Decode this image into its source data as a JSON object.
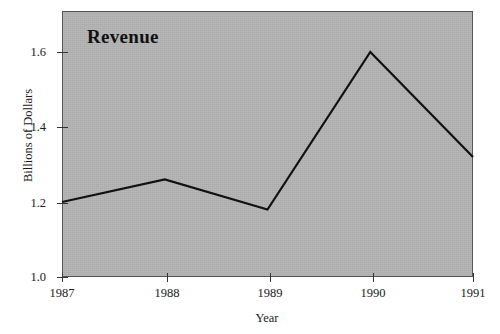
{
  "chart_data": {
    "type": "line",
    "title": "Revenue",
    "xlabel": "Year",
    "ylabel": "Billions of Dollars",
    "categories": [
      "1987",
      "1988",
      "1989",
      "1990",
      "1991"
    ],
    "x": [
      1987,
      1988,
      1989,
      1990,
      1991
    ],
    "values": [
      1.2,
      1.26,
      1.18,
      1.6,
      1.32
    ],
    "series": [
      {
        "name": "Revenue",
        "values": [
          1.2,
          1.26,
          1.18,
          1.6,
          1.32
        ]
      }
    ],
    "xlim": [
      1987,
      1991
    ],
    "ylim": [
      1.0,
      1.7
    ],
    "ytick_labels": [
      "1.0",
      "1.2",
      "1.4",
      "1.6"
    ],
    "ytick_values": [
      1.0,
      1.2,
      1.4,
      1.6
    ],
    "xtick_labels": [
      "1987",
      "1988",
      "1989",
      "1990",
      "1991"
    ],
    "grid": false,
    "legend": "none",
    "line_color": "#111111",
    "plot_background_color": "#b4b4b4",
    "figure_background_color": "#ffffff",
    "axis_color": "#333333"
  }
}
